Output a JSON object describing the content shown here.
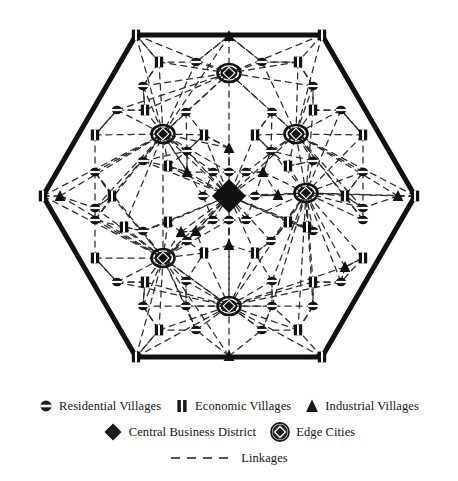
{
  "figure": {
    "shape": "hexagon",
    "stroke_color": "#111111",
    "link_color": "#2b2b2b",
    "background": "#ffffff"
  },
  "legend": {
    "rows": [
      {
        "items": [
          {
            "icon": "residential-village-icon",
            "label": "Residential Villages"
          },
          {
            "icon": "economic-village-icon",
            "label": "Economic Villages"
          },
          {
            "icon": "industrial-village-icon",
            "label": "Industrial Villages"
          }
        ]
      },
      {
        "items": [
          {
            "icon": "central-business-district-icon",
            "label": "Central Business District"
          },
          {
            "icon": "edge-city-icon",
            "label": "Edge Cities"
          }
        ]
      },
      {
        "items": [
          {
            "icon": "dashed-line-icon",
            "label": "Linkages"
          }
        ]
      }
    ]
  },
  "chart_data": {
    "type": "diagram",
    "boundary": {
      "type": "hexagon",
      "center": [
        229,
        196
      ],
      "radius": 186,
      "orientation": "flat-top",
      "vertices": [
        [
          136,
          35
        ],
        [
          322,
          35
        ],
        [
          415,
          196
        ],
        [
          322,
          357
        ],
        [
          136,
          357
        ],
        [
          43,
          196
        ]
      ]
    },
    "node_types": [
      {
        "key": "residential",
        "label": "Residential Villages",
        "glyph": "oval-with-band"
      },
      {
        "key": "economic",
        "label": "Economic Villages",
        "glyph": "rect-with-stripe"
      },
      {
        "key": "industrial",
        "label": "Industrial Villages",
        "glyph": "filled-triangle"
      },
      {
        "key": "cbd",
        "label": "Central Business District",
        "glyph": "large-filled-diamond"
      },
      {
        "key": "edge",
        "label": "Edge Cities",
        "glyph": "circle-with-diamond"
      }
    ],
    "counts": {
      "central_business_district": 1,
      "edge_cities": 6,
      "industrial_villages": 12,
      "economic_villages": 30,
      "residential_villages": 54
    },
    "nodes": [
      {
        "type": "cbd",
        "x": 229,
        "y": 196
      },
      {
        "type": "edge",
        "x": 229,
        "y": 73
      },
      {
        "type": "edge",
        "x": 163,
        "y": 134
      },
      {
        "type": "edge",
        "x": 296,
        "y": 134
      },
      {
        "type": "edge",
        "x": 163,
        "y": 258
      },
      {
        "type": "edge",
        "x": 306,
        "y": 193
      },
      {
        "type": "edge",
        "x": 229,
        "y": 306
      },
      {
        "type": "industrial",
        "x": 229,
        "y": 36
      },
      {
        "type": "industrial",
        "x": 229,
        "y": 356
      },
      {
        "type": "industrial",
        "x": 60,
        "y": 196
      },
      {
        "type": "industrial",
        "x": 398,
        "y": 196
      },
      {
        "type": "industrial",
        "x": 229,
        "y": 148
      },
      {
        "type": "industrial",
        "x": 229,
        "y": 245
      },
      {
        "type": "industrial",
        "x": 187,
        "y": 172
      },
      {
        "type": "industrial",
        "x": 263,
        "y": 172
      },
      {
        "type": "industrial",
        "x": 181,
        "y": 232
      },
      {
        "type": "industrial",
        "x": 278,
        "y": 195
      },
      {
        "type": "industrial",
        "x": 196,
        "y": 231
      },
      {
        "type": "industrial",
        "x": 345,
        "y": 267
      },
      {
        "type": "economic",
        "x": 136,
        "y": 35
      },
      {
        "type": "economic",
        "x": 322,
        "y": 35
      },
      {
        "type": "economic",
        "x": 415,
        "y": 196
      },
      {
        "type": "economic",
        "x": 322,
        "y": 357
      },
      {
        "type": "economic",
        "x": 136,
        "y": 357
      },
      {
        "type": "economic",
        "x": 43,
        "y": 196
      },
      {
        "type": "economic",
        "x": 159,
        "y": 62
      },
      {
        "type": "economic",
        "x": 298,
        "y": 62
      },
      {
        "type": "economic",
        "x": 95,
        "y": 135
      },
      {
        "type": "economic",
        "x": 363,
        "y": 135
      },
      {
        "type": "economic",
        "x": 95,
        "y": 258
      },
      {
        "type": "economic",
        "x": 363,
        "y": 258
      },
      {
        "type": "economic",
        "x": 159,
        "y": 330
      },
      {
        "type": "economic",
        "x": 298,
        "y": 330
      },
      {
        "type": "economic",
        "x": 145,
        "y": 110
      },
      {
        "type": "economic",
        "x": 313,
        "y": 110
      },
      {
        "type": "economic",
        "x": 112,
        "y": 196
      },
      {
        "type": "economic",
        "x": 345,
        "y": 196
      },
      {
        "type": "economic",
        "x": 145,
        "y": 282
      },
      {
        "type": "economic",
        "x": 313,
        "y": 282
      },
      {
        "type": "economic",
        "x": 204,
        "y": 135
      },
      {
        "type": "economic",
        "x": 255,
        "y": 135
      },
      {
        "type": "economic",
        "x": 168,
        "y": 166
      },
      {
        "type": "economic",
        "x": 288,
        "y": 166
      },
      {
        "type": "economic",
        "x": 168,
        "y": 222
      },
      {
        "type": "economic",
        "x": 288,
        "y": 222
      },
      {
        "type": "economic",
        "x": 204,
        "y": 253
      },
      {
        "type": "economic",
        "x": 255,
        "y": 253
      },
      {
        "type": "economic",
        "x": 124,
        "y": 227
      },
      {
        "type": "economic",
        "x": 307,
        "y": 227
      },
      {
        "type": "residential",
        "x": 196,
        "y": 62
      },
      {
        "type": "residential",
        "x": 262,
        "y": 62
      },
      {
        "type": "residential",
        "x": 143,
        "y": 86
      },
      {
        "type": "residential",
        "x": 313,
        "y": 86
      },
      {
        "type": "residential",
        "x": 117,
        "y": 110
      },
      {
        "type": "residential",
        "x": 341,
        "y": 110
      },
      {
        "type": "residential",
        "x": 186,
        "y": 112
      },
      {
        "type": "residential",
        "x": 272,
        "y": 112
      },
      {
        "type": "residential",
        "x": 187,
        "y": 151
      },
      {
        "type": "residential",
        "x": 271,
        "y": 151
      },
      {
        "type": "residential",
        "x": 143,
        "y": 161
      },
      {
        "type": "residential",
        "x": 313,
        "y": 161
      },
      {
        "type": "residential",
        "x": 95,
        "y": 172
      },
      {
        "type": "residential",
        "x": 363,
        "y": 172
      },
      {
        "type": "residential",
        "x": 213,
        "y": 172
      },
      {
        "type": "residential",
        "x": 246,
        "y": 172
      },
      {
        "type": "residential",
        "x": 229,
        "y": 172
      },
      {
        "type": "residential",
        "x": 203,
        "y": 196
      },
      {
        "type": "residential",
        "x": 255,
        "y": 196
      },
      {
        "type": "residential",
        "x": 229,
        "y": 220
      },
      {
        "type": "residential",
        "x": 213,
        "y": 220
      },
      {
        "type": "residential",
        "x": 246,
        "y": 220
      },
      {
        "type": "residential",
        "x": 95,
        "y": 220
      },
      {
        "type": "residential",
        "x": 363,
        "y": 220
      },
      {
        "type": "residential",
        "x": 143,
        "y": 231
      },
      {
        "type": "residential",
        "x": 313,
        "y": 231
      },
      {
        "type": "residential",
        "x": 187,
        "y": 241
      },
      {
        "type": "residential",
        "x": 271,
        "y": 241
      },
      {
        "type": "residential",
        "x": 186,
        "y": 281
      },
      {
        "type": "residential",
        "x": 272,
        "y": 281
      },
      {
        "type": "residential",
        "x": 117,
        "y": 282
      },
      {
        "type": "residential",
        "x": 341,
        "y": 282
      },
      {
        "type": "residential",
        "x": 143,
        "y": 306
      },
      {
        "type": "residential",
        "x": 313,
        "y": 306
      },
      {
        "type": "residential",
        "x": 196,
        "y": 330
      },
      {
        "type": "residential",
        "x": 262,
        "y": 330
      },
      {
        "type": "residential",
        "x": 186,
        "y": 306
      },
      {
        "type": "residential",
        "x": 272,
        "y": 306
      },
      {
        "type": "residential",
        "x": 95,
        "y": 208
      },
      {
        "type": "residential",
        "x": 363,
        "y": 208
      }
    ],
    "link_style": {
      "dash": "6 5",
      "width": 1.3,
      "color": "#2b2b2b"
    }
  }
}
